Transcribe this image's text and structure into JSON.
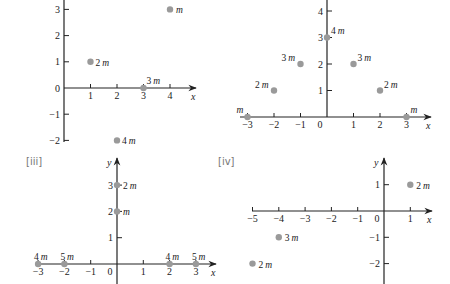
{
  "colors": {
    "axis": "#222222",
    "dot": "#9a9a9a",
    "panel_label": "#777777"
  },
  "panels": [
    {
      "id": "i",
      "label": "",
      "origin_px": [
        64,
        88
      ],
      "unit_px": [
        26.5,
        26.2
      ],
      "x_range": [
        0,
        4
      ],
      "y_range": [
        -2,
        3
      ],
      "x_ticks": [
        1,
        2,
        3,
        4
      ],
      "y_ticks": [
        3,
        2,
        1,
        0,
        -1,
        -2
      ],
      "x_label_zero": false,
      "x_axis": {
        "from": 0,
        "to_px": 196,
        "arrow": true,
        "name": "x"
      },
      "y_axis": {
        "top_px": 0,
        "bottom_px": 142,
        "arrow": false,
        "name": ""
      },
      "points": [
        {
          "x": 4,
          "y": 3,
          "mass": "",
          "label_dx": 6,
          "label_dy": 4
        },
        {
          "x": 1,
          "y": 1,
          "mass": "2",
          "label_dx": 5,
          "label_dy": 4
        },
        {
          "x": 3,
          "y": 0,
          "mass": "3",
          "label_dx": 3,
          "label_dy": -4
        },
        {
          "x": 2,
          "y": -2,
          "mass": "4",
          "label_dx": 5,
          "label_dy": 4
        }
      ]
    },
    {
      "id": "ii",
      "label": "",
      "origin_px": [
        327,
        117
      ],
      "unit_px": [
        26.5,
        26.5
      ],
      "x_range": [
        -3,
        3
      ],
      "y_range": [
        0,
        4
      ],
      "x_ticks": [
        -3,
        -2,
        -1,
        0,
        1,
        2,
        3
      ],
      "y_ticks": [
        4,
        3,
        2,
        1
      ],
      "x_axis": {
        "from_px": 240,
        "to_px": 431,
        "arrow": true,
        "name": "x"
      },
      "y_axis": {
        "top_px": 0,
        "bottom_px": 117,
        "arrow": false,
        "name": ""
      },
      "points": [
        {
          "x": 0,
          "y": 3,
          "mass": "4",
          "label_dx": 4,
          "label_dy": -4
        },
        {
          "x": -1,
          "y": 2,
          "mass": "3",
          "label_dx": -19,
          "label_dy": -3
        },
        {
          "x": 1,
          "y": 2,
          "mass": "3",
          "label_dx": 4,
          "label_dy": -3
        },
        {
          "x": -2,
          "y": 1,
          "mass": "2",
          "label_dx": -19,
          "label_dy": -3
        },
        {
          "x": 2,
          "y": 1,
          "mass": "2",
          "label_dx": 4,
          "label_dy": -3
        },
        {
          "x": -3,
          "y": 0,
          "mass": "",
          "label_dx": -11,
          "label_dy": -4
        },
        {
          "x": 3,
          "y": 0,
          "mass": "",
          "label_dx": 4,
          "label_dy": -4
        }
      ]
    },
    {
      "id": "iii",
      "label": "[iii]",
      "label_px": [
        26,
        165
      ],
      "origin_px": [
        117,
        264
      ],
      "unit_px": [
        26.3,
        26.3
      ],
      "x_range": [
        -3,
        3
      ],
      "y_range": [
        0,
        3
      ],
      "x_ticks": [
        -3,
        -2,
        -1,
        0,
        1,
        2,
        3
      ],
      "y_ticks": [
        3,
        2,
        1
      ],
      "x_axis": {
        "from_px": 36,
        "to_px": 216,
        "arrow": true,
        "name": "x"
      },
      "y_axis": {
        "top_px": 158,
        "bottom_px": 284,
        "arrow": true,
        "name": "y"
      },
      "points": [
        {
          "x": 0,
          "y": 3,
          "mass": "2",
          "label_dx": 6,
          "label_dy": 4
        },
        {
          "x": 0,
          "y": 2,
          "mass": "",
          "label_dx": 6,
          "label_dy": 4
        },
        {
          "x": -3,
          "y": 0,
          "mass": "4",
          "label_dx": -4,
          "label_dy": -4
        },
        {
          "x": -2,
          "y": 0,
          "mass": "5",
          "label_dx": -4,
          "label_dy": -4
        },
        {
          "x": 2,
          "y": 0,
          "mass": "4",
          "label_dx": -4,
          "label_dy": -4
        },
        {
          "x": 3,
          "y": 0,
          "mass": "5",
          "label_dx": -4,
          "label_dy": -4
        }
      ]
    },
    {
      "id": "iv",
      "label": "[iv]",
      "label_px": [
        218,
        165
      ],
      "origin_px": [
        384,
        211
      ],
      "unit_px": [
        26.3,
        26.3
      ],
      "x_range": [
        -5,
        1
      ],
      "y_range": [
        -2,
        1
      ],
      "x_ticks": [
        -5,
        -4,
        -3,
        -2,
        -1,
        0,
        1
      ],
      "y_ticks": [
        1,
        -1,
        -2
      ],
      "x_axis": {
        "from_px": 252,
        "to_px": 432,
        "arrow": true,
        "name": "x"
      },
      "y_axis": {
        "top_px": 158,
        "bottom_px": 284,
        "arrow": true,
        "name": "y"
      },
      "points": [
        {
          "x": 1,
          "y": 1,
          "mass": "2",
          "label_dx": 6,
          "label_dy": 4
        },
        {
          "x": -4,
          "y": -1,
          "mass": "3",
          "label_dx": 6,
          "label_dy": 4
        },
        {
          "x": -5,
          "y": -2,
          "mass": "2",
          "label_dx": 6,
          "label_dy": 4
        }
      ]
    }
  ],
  "mass_unit": "m"
}
